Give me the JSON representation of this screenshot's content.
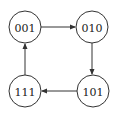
{
  "diagram": {
    "type": "state-transition-cycle",
    "nodes": [
      {
        "id": "n001",
        "label": "001",
        "cx": 25,
        "cy": 27
      },
      {
        "id": "n010",
        "label": "010",
        "cx": 92,
        "cy": 27
      },
      {
        "id": "n101",
        "label": "101",
        "cx": 93,
        "cy": 91
      },
      {
        "id": "n111",
        "label": "111",
        "cx": 25,
        "cy": 91
      }
    ],
    "edges": [
      {
        "from": "001",
        "to": "010"
      },
      {
        "from": "010",
        "to": "101"
      },
      {
        "from": "101",
        "to": "111"
      },
      {
        "from": "111",
        "to": "001"
      }
    ],
    "colors": {
      "stroke": "#333333",
      "text": "#222222",
      "background": "#ffffff"
    }
  }
}
